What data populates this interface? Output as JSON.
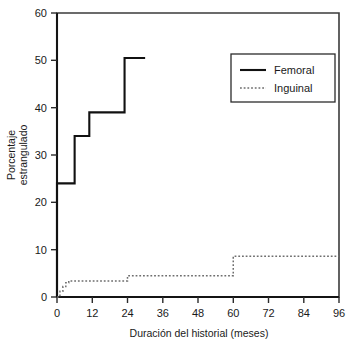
{
  "chart_data": {
    "type": "line",
    "title": "",
    "xlabel": "Duración del historial (meses)",
    "ylabel_line1": "Porcentaje",
    "ylabel_line2": "estrangulado",
    "xlim": [
      0,
      96
    ],
    "ylim": [
      0,
      60
    ],
    "xticks": [
      0,
      12,
      24,
      36,
      48,
      60,
      72,
      84,
      96
    ],
    "xtick_labels": [
      "0",
      "12",
      "24",
      "36",
      "48",
      "60",
      "72",
      "84",
      "96"
    ],
    "yticks": [
      0,
      10,
      20,
      30,
      40,
      50,
      60
    ],
    "ytick_labels": [
      "0",
      "10",
      "20",
      "30",
      "40",
      "50",
      "60"
    ],
    "grid": false,
    "legend_position": "upper right",
    "drawstyle": "steps-post",
    "series": [
      {
        "name": "Femoral",
        "style": "solid",
        "color": "#111111",
        "x": [
          0,
          0,
          6,
          11,
          23,
          30
        ],
        "y": [
          0,
          24,
          34,
          39,
          50.5,
          50.5
        ]
      },
      {
        "name": "Inguinal",
        "style": "dotted",
        "color": "#6e6e6e",
        "x": [
          0,
          1,
          2,
          3,
          4,
          24,
          60,
          96
        ],
        "y": [
          0,
          1.2,
          2.2,
          3.0,
          3.4,
          4.5,
          8.6,
          8.6
        ]
      }
    ],
    "legend": [
      {
        "label": "Femoral",
        "style": "solid",
        "color": "#111111"
      },
      {
        "label": "Inguinal",
        "style": "dotted",
        "color": "#6e6e6e"
      }
    ]
  }
}
